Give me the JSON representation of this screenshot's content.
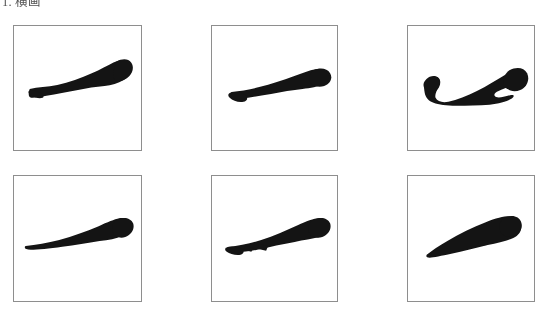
{
  "page": {
    "background_color": "#ffffff",
    "ink_color": "#141414",
    "border_color": "#8e8e8e"
  },
  "heading": {
    "number": "1.",
    "title": "横画",
    "full_text": "1. 横画"
  },
  "plates": {
    "rows": 2,
    "columns": 3,
    "items": [
      {
        "position": "row1-col1",
        "caption": "",
        "stroke_name": "heng-stroke-variant-1",
        "description": "horizontal brush stroke, thin tapered start at lower left rising to a heavy blunt knot at the right"
      },
      {
        "position": "row1-col2",
        "caption": "",
        "stroke_name": "heng-stroke-variant-2",
        "description": "horizontal brush stroke, broad wedge at left tapering and rising to a rounded heavy end at right"
      },
      {
        "position": "row1-col3",
        "caption": "",
        "stroke_name": "heng-stroke-variant-3",
        "description": "horizontal brush stroke with hooked head at left, slender waist and a notched heavy club end at right"
      },
      {
        "position": "row2-col1",
        "caption": "",
        "stroke_name": "heng-stroke-variant-4",
        "description": "horizontal brush stroke, hairline pointed entry at left swelling into a rounded heavy knot at the right"
      },
      {
        "position": "row2-col2",
        "caption": "",
        "stroke_name": "heng-stroke-variant-5",
        "description": "horizontal brush stroke with dry split brush at left, thickening to a square heavy terminal at right"
      },
      {
        "position": "row2-col3",
        "caption": "",
        "stroke_name": "heng-stroke-variant-6",
        "description": "thick horizontal brush stroke, flat chisel entry at lower left rising to a blunt heavy end at upper right"
      }
    ]
  }
}
